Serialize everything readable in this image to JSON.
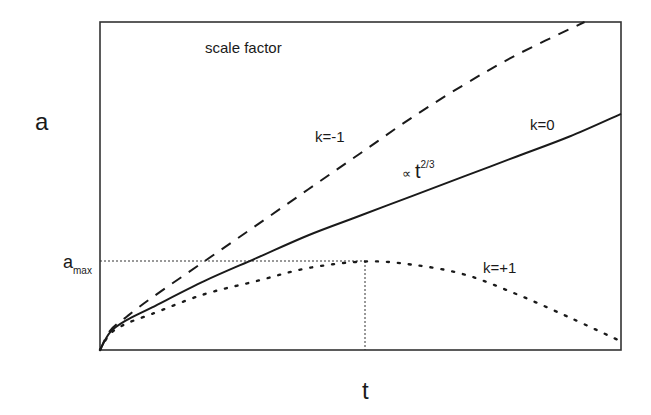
{
  "title": "scale factor",
  "axes": {
    "ylabel": "a",
    "xlabel": "t",
    "ytick_label": {
      "main": "a",
      "sub": "max"
    }
  },
  "annotations": {
    "k_neg1": "k=-1",
    "k_zero": "k=0",
    "k_pos1": "k=+1",
    "proportional": {
      "symbol": "∝",
      "base": "t",
      "exponent": "2/3"
    }
  },
  "colors": {
    "line": "#1a1a1a",
    "frame": "#333333",
    "background": "#ffffff"
  },
  "chart_data": {
    "type": "line",
    "title": "scale factor",
    "xlabel": "t",
    "ylabel": "a",
    "grid": false,
    "legend": "inline labels on curves",
    "xlim": [
      0,
      1
    ],
    "ylim": [
      0,
      1
    ],
    "reference_lines": [
      {
        "orientation": "horizontal",
        "y": 0.27,
        "label": "a_max",
        "style": "dotted",
        "x_range": [
          0,
          0.51
        ]
      },
      {
        "orientation": "vertical",
        "x": 0.51,
        "style": "dotted",
        "y_range": [
          0,
          0.27
        ]
      }
    ],
    "series": [
      {
        "name": "k=-1",
        "style": "dashed",
        "x": [
          0,
          0.02,
          0.05,
          0.1,
          0.2,
          0.3,
          0.4,
          0.5,
          0.6,
          0.7,
          0.8,
          0.93
        ],
        "y": [
          0,
          0.06,
          0.1,
          0.16,
          0.27,
          0.38,
          0.49,
          0.6,
          0.71,
          0.81,
          0.9,
          1.0
        ]
      },
      {
        "name": "k=0",
        "annotation": "∝ t^(2/3)",
        "style": "solid",
        "x": [
          0,
          0.02,
          0.05,
          0.1,
          0.2,
          0.3,
          0.4,
          0.5,
          0.6,
          0.7,
          0.8,
          0.9,
          1.0
        ],
        "y": [
          0,
          0.055,
          0.09,
          0.13,
          0.21,
          0.28,
          0.35,
          0.41,
          0.47,
          0.53,
          0.59,
          0.65,
          0.72
        ]
      },
      {
        "name": "k=+1",
        "style": "dotted",
        "x": [
          0,
          0.02,
          0.05,
          0.1,
          0.2,
          0.3,
          0.4,
          0.51,
          0.6,
          0.7,
          0.8,
          0.9,
          0.995
        ],
        "y": [
          0,
          0.05,
          0.08,
          0.11,
          0.17,
          0.21,
          0.25,
          0.27,
          0.26,
          0.23,
          0.17,
          0.1,
          0.03
        ]
      }
    ]
  }
}
